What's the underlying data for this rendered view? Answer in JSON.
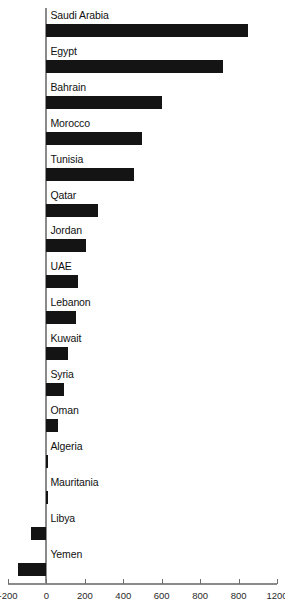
{
  "chart_data": {
    "type": "bar",
    "orientation": "horizontal",
    "title": "",
    "subtitle": "",
    "xlabel": "",
    "ylabel": "",
    "xlim": [
      -200,
      1200
    ],
    "grid": false,
    "legend": null,
    "bar_color": "#141414",
    "axis_color": "#8a8a8a",
    "xticks": [
      -200,
      0,
      200,
      400,
      600,
      800,
      1000,
      1200
    ],
    "xtick_labels": [
      "-200",
      "0",
      "200",
      "400",
      "600",
      "800",
      "800",
      "1200"
    ],
    "categories": [
      "Saudi Arabia",
      "Egypt",
      "Bahrain",
      "Morocco",
      "Tunisia",
      "Qatar",
      "Jordan",
      "UAE",
      "Lebanon",
      "Kuwait",
      "Syria",
      "Oman",
      "Algeria",
      "Mauritania",
      "Libya",
      "Yemen"
    ],
    "values": [
      1050,
      920,
      600,
      495,
      455,
      270,
      205,
      165,
      155,
      110,
      90,
      60,
      5,
      5,
      -80,
      -150
    ]
  }
}
